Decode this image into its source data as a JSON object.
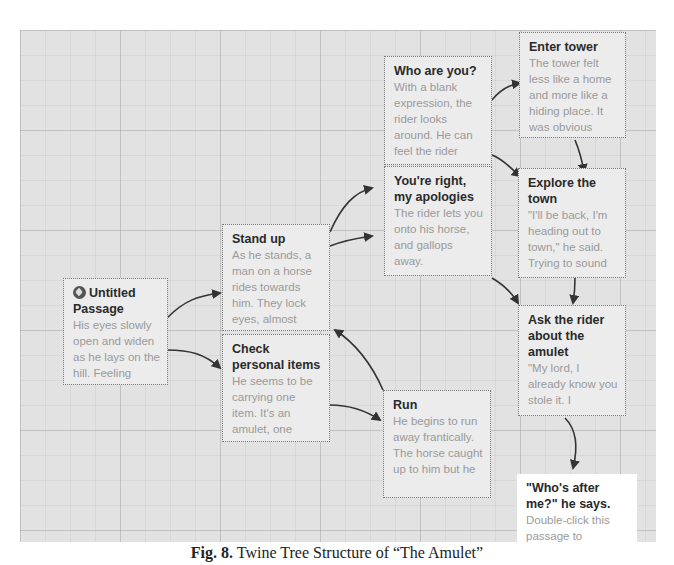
{
  "diagram": {
    "type": "twine-story-map",
    "nodes": [
      {
        "id": "untitled",
        "title": "Untitled Passage",
        "excerpt": "His eyes slowly open and widen as he lays on the hill. Feeling",
        "is_start": true,
        "icon": "rocket-start-icon"
      },
      {
        "id": "stand-up",
        "title": "Stand up",
        "excerpt": "As he stands, a man on a horse rides towards him. They lock eyes, almost"
      },
      {
        "id": "check-items",
        "title": "Check personal items",
        "excerpt": "He seems to be carrying one item. It's an amulet, one"
      },
      {
        "id": "who-are-you",
        "title": "Who are you?",
        "excerpt": "With a blank expression, the rider looks around. He can feel the rider"
      },
      {
        "id": "youre-right",
        "title": "You're right, my apologies",
        "excerpt": "The rider lets you onto his horse, and gallops away."
      },
      {
        "id": "run",
        "title": "Run",
        "excerpt": "He begins to run away frantically. The horse caught up to him but he"
      },
      {
        "id": "enter-tower",
        "title": "Enter tower",
        "excerpt": "The tower felt less like a home and more like a hiding place. It was obvious"
      },
      {
        "id": "explore-town",
        "title": "Explore the town",
        "excerpt": "\"I'll be back, I'm heading out to town,\" he said. Trying to sound"
      },
      {
        "id": "ask-rider",
        "title": "Ask the rider about the amulet",
        "excerpt": "\"My lord, I already know you stole it. I"
      },
      {
        "id": "whos-after-me",
        "title": "\"Who's after me?\" he says.",
        "excerpt": "Double-click this passage to",
        "highlighted": true
      }
    ],
    "links": [
      {
        "from": "untitled",
        "to": "stand-up"
      },
      {
        "from": "untitled",
        "to": "check-items"
      },
      {
        "from": "stand-up",
        "to": "who-are-you"
      },
      {
        "from": "stand-up",
        "to": "youre-right"
      },
      {
        "from": "check-items",
        "to": "run"
      },
      {
        "from": "run",
        "to": "stand-up"
      },
      {
        "from": "who-are-you",
        "to": "enter-tower"
      },
      {
        "from": "who-are-you",
        "to": "explore-town"
      },
      {
        "from": "enter-tower",
        "to": "explore-town"
      },
      {
        "from": "youre-right",
        "to": "ask-rider"
      },
      {
        "from": "explore-town",
        "to": "ask-rider"
      },
      {
        "from": "ask-rider",
        "to": "whos-after-me"
      }
    ]
  },
  "caption": {
    "label": "Fig. 8.",
    "text": "Twine Tree Structure of “The Amulet”"
  },
  "colors": {
    "canvas": "#e2e2e2",
    "node": "#ececec",
    "node_title": "#2a2a2a",
    "node_excerpt": "#9a9a9a",
    "arrow": "#333333",
    "highlight_node": "#ffffff"
  }
}
